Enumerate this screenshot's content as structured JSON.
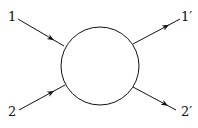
{
  "diagram": {
    "type": "scattering-vertex",
    "labels": {
      "in1": "1",
      "in2": "2",
      "out1": "1′",
      "out2": "2′"
    },
    "colors": {
      "stroke": "#111111",
      "background": "#ffffff"
    }
  }
}
